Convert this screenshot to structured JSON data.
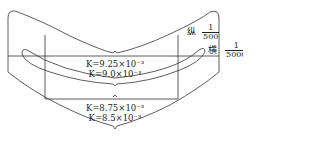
{
  "diagram": {
    "type": "curved panel plate development with crescent slot",
    "zones": [
      {
        "name": "upper zone",
        "labels": [
          "K=9.25×10⁻³",
          "K=9.0×10⁻³"
        ]
      },
      {
        "name": "lower zone",
        "labels": [
          "K=8.75×10⁻³",
          "K=8.5×10⁻³"
        ]
      }
    ],
    "scales": {
      "vertical": {
        "label": "纵",
        "numerator": "1",
        "denominator": "500"
      },
      "horizontal": {
        "label": "横",
        "numerator": "1",
        "denominator": "5000"
      }
    },
    "colors": {
      "stroke": "#333333",
      "text": "#222222",
      "background": "#ffffff"
    }
  }
}
